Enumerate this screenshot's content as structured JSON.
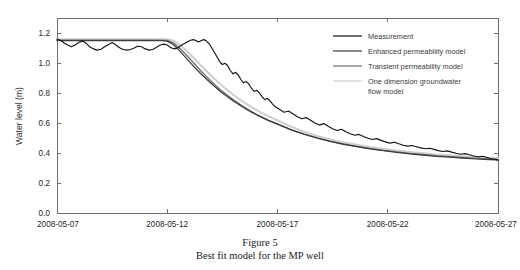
{
  "caption": {
    "line1": "Figure 5",
    "line2": "Best fit model for the MP well"
  },
  "chart_data": {
    "type": "line",
    "title": "",
    "xlabel": "",
    "ylabel": "Water level (m)",
    "xlim": [
      0,
      20
    ],
    "ylim": [
      0.0,
      1.3
    ],
    "grid": false,
    "legend_position": "top-right",
    "x_tick_labels": [
      "2008-05-07",
      "2008-05-12",
      "2008-05-17",
      "2008-05-22",
      "2008-05-27"
    ],
    "x_tick_values": [
      0,
      5,
      10,
      15,
      20
    ],
    "y_tick_labels": [
      "0.0",
      "0.2",
      "0.4",
      "0.6",
      "0.8",
      "1.0",
      "1.2"
    ],
    "y_tick_values": [
      0.0,
      0.2,
      0.4,
      0.6,
      0.8,
      1.0,
      1.2
    ],
    "legend_entries": [
      {
        "label": "Measurement",
        "color": "#141414"
      },
      {
        "label": "Enhanced permeability model",
        "color": "#3c3c3c"
      },
      {
        "label": "Transient permeability model",
        "color": "#707070"
      },
      {
        "label": "One dimension groundwater flow model",
        "color": "#cfcfcf"
      }
    ],
    "series": [
      {
        "name": "Measurement",
        "color": "#141414",
        "x": [
          0.0,
          0.18,
          0.34,
          0.5,
          0.66,
          0.82,
          1.0,
          1.16,
          1.32,
          1.48,
          1.66,
          1.82,
          2.0,
          2.16,
          2.34,
          2.5,
          2.66,
          2.84,
          3.0,
          3.16,
          3.34,
          3.5,
          3.66,
          3.84,
          4.0,
          4.18,
          4.34,
          4.5,
          4.66,
          4.84,
          5.0,
          5.1,
          5.22,
          5.34,
          5.46,
          5.58,
          5.7,
          5.82,
          5.94,
          6.06,
          6.18,
          6.3,
          6.42,
          6.54,
          6.66,
          6.78,
          6.9,
          7.02,
          7.14,
          7.26,
          7.38,
          7.5,
          7.62,
          7.74,
          7.86,
          7.98,
          8.1,
          8.22,
          8.34,
          8.46,
          8.58,
          8.7,
          8.82,
          8.94,
          9.06,
          9.18,
          9.3,
          9.42,
          9.54,
          9.66,
          9.78,
          9.9,
          10.1,
          10.3,
          10.5,
          10.7,
          10.9,
          11.1,
          11.3,
          11.5,
          11.7,
          11.9,
          12.1,
          12.3,
          12.5,
          12.7,
          12.9,
          13.1,
          13.3,
          13.5,
          13.7,
          13.9,
          14.1,
          14.3,
          14.5,
          14.7,
          14.9,
          15.1,
          15.3,
          15.5,
          15.7,
          15.9,
          16.1,
          16.3,
          16.5,
          16.7,
          16.9,
          17.1,
          17.3,
          17.5,
          17.7,
          17.9,
          18.1,
          18.3,
          18.5,
          18.7,
          18.9,
          19.1,
          19.3,
          19.5,
          19.7,
          19.9,
          20.0
        ],
        "y": [
          1.16,
          1.15,
          1.132,
          1.118,
          1.108,
          1.12,
          1.138,
          1.146,
          1.132,
          1.108,
          1.094,
          1.086,
          1.092,
          1.108,
          1.124,
          1.136,
          1.122,
          1.102,
          1.09,
          1.086,
          1.09,
          1.1,
          1.112,
          1.108,
          1.094,
          1.086,
          1.09,
          1.104,
          1.118,
          1.126,
          1.12,
          1.108,
          1.098,
          1.094,
          1.1,
          1.112,
          1.124,
          1.134,
          1.144,
          1.152,
          1.156,
          1.15,
          1.14,
          1.15,
          1.156,
          1.146,
          1.128,
          1.1,
          1.07,
          1.04,
          1.008,
          0.99,
          0.998,
          0.982,
          0.95,
          0.928,
          0.938,
          0.92,
          0.89,
          0.868,
          0.876,
          0.86,
          0.832,
          0.81,
          0.818,
          0.8,
          0.776,
          0.756,
          0.764,
          0.748,
          0.726,
          0.708,
          0.69,
          0.672,
          0.68,
          0.662,
          0.642,
          0.628,
          0.636,
          0.618,
          0.6,
          0.586,
          0.596,
          0.578,
          0.562,
          0.55,
          0.558,
          0.542,
          0.528,
          0.518,
          0.524,
          0.51,
          0.498,
          0.49,
          0.496,
          0.484,
          0.474,
          0.466,
          0.472,
          0.462,
          0.452,
          0.446,
          0.45,
          0.442,
          0.434,
          0.428,
          0.432,
          0.424,
          0.416,
          0.41,
          0.414,
          0.406,
          0.398,
          0.392,
          0.396,
          0.388,
          0.38,
          0.374,
          0.378,
          0.37,
          0.362,
          0.356,
          0.352
        ]
      },
      {
        "name": "Enhanced permeability model",
        "color": "#3c3c3c",
        "x": [
          0.0,
          1.0,
          2.0,
          3.0,
          4.0,
          4.6,
          5.0,
          5.3,
          5.6,
          5.9,
          6.2,
          6.5,
          6.8,
          7.1,
          7.4,
          7.7,
          8.0,
          8.4,
          8.8,
          9.2,
          9.6,
          10.0,
          10.6,
          11.2,
          11.8,
          12.4,
          13.0,
          13.6,
          14.2,
          14.8,
          15.4,
          16.0,
          16.6,
          17.2,
          17.8,
          18.4,
          19.0,
          19.6,
          20.0
        ],
        "y": [
          1.15,
          1.15,
          1.15,
          1.15,
          1.15,
          1.15,
          1.146,
          1.12,
          1.076,
          1.026,
          0.978,
          0.932,
          0.89,
          0.85,
          0.812,
          0.778,
          0.746,
          0.708,
          0.674,
          0.644,
          0.616,
          0.592,
          0.556,
          0.526,
          0.5,
          0.478,
          0.458,
          0.442,
          0.428,
          0.416,
          0.404,
          0.394,
          0.386,
          0.378,
          0.372,
          0.366,
          0.36,
          0.356,
          0.354
        ]
      },
      {
        "name": "Transient permeability model",
        "color": "#707070",
        "x": [
          0.0,
          1.0,
          2.0,
          3.0,
          4.0,
          4.6,
          5.0,
          5.3,
          5.6,
          5.9,
          6.2,
          6.5,
          6.8,
          7.1,
          7.4,
          7.7,
          8.0,
          8.4,
          8.8,
          9.2,
          9.6,
          10.0,
          10.6,
          11.2,
          11.8,
          12.4,
          13.0,
          13.6,
          14.2,
          14.8,
          15.4,
          16.0,
          16.6,
          17.2,
          17.8,
          18.4,
          19.0,
          19.6,
          20.0
        ],
        "y": [
          1.152,
          1.152,
          1.152,
          1.152,
          1.152,
          1.152,
          1.15,
          1.132,
          1.094,
          1.048,
          1.0,
          0.952,
          0.906,
          0.864,
          0.824,
          0.788,
          0.754,
          0.714,
          0.678,
          0.646,
          0.618,
          0.594,
          0.556,
          0.526,
          0.5,
          0.478,
          0.46,
          0.444,
          0.43,
          0.418,
          0.408,
          0.398,
          0.39,
          0.382,
          0.376,
          0.37,
          0.364,
          0.36,
          0.358
        ]
      },
      {
        "name": "One dimension groundwater flow model",
        "color": "#cfcfcf",
        "x": [
          0.0,
          1.0,
          2.0,
          3.0,
          4.0,
          4.6,
          5.0,
          5.3,
          5.6,
          5.9,
          6.2,
          6.5,
          6.8,
          7.1,
          7.4,
          7.7,
          8.0,
          8.4,
          8.8,
          9.2,
          9.6,
          10.0,
          10.6,
          11.2,
          11.8,
          12.4,
          13.0,
          13.6,
          14.2,
          14.8,
          15.4,
          16.0,
          16.6,
          17.2,
          17.8,
          18.4,
          19.0,
          19.6,
          20.0
        ],
        "y": [
          1.158,
          1.158,
          1.158,
          1.158,
          1.158,
          1.158,
          1.158,
          1.148,
          1.118,
          1.078,
          1.034,
          0.988,
          0.944,
          0.9,
          0.86,
          0.822,
          0.788,
          0.746,
          0.708,
          0.674,
          0.644,
          0.618,
          0.576,
          0.542,
          0.514,
          0.49,
          0.47,
          0.454,
          0.44,
          0.428,
          0.416,
          0.406,
          0.398,
          0.39,
          0.384,
          0.378,
          0.372,
          0.368,
          0.366
        ]
      }
    ]
  }
}
